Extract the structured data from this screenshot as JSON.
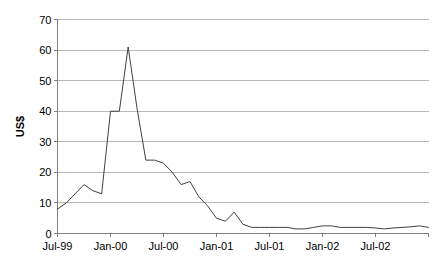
{
  "chart_data": {
    "type": "line",
    "title": "",
    "xlabel": "",
    "ylabel": "US$",
    "ylim": [
      0,
      70
    ],
    "ytick_values": [
      0,
      10,
      20,
      30,
      40,
      50,
      60,
      70
    ],
    "ytick_labels": [
      "0",
      "10",
      "20",
      "30",
      "40",
      "50",
      "60",
      "70"
    ],
    "grid": true,
    "legend": "none",
    "xtick_labels": [
      "Jul-99",
      "Jan-00",
      "Jul-00",
      "Jan-01",
      "Jul-01",
      "Jan-02",
      "Jul-02"
    ],
    "xtick_indices": [
      0,
      6,
      12,
      18,
      24,
      30,
      36
    ],
    "x_index_max": 42,
    "series": [
      {
        "name": "US$",
        "x": [
          "Jul-99",
          "Aug-99",
          "Sep-99",
          "Oct-99",
          "Nov-99",
          "Dec-99",
          "Jan-00",
          "Feb-00",
          "Mar-00",
          "Apr-00",
          "May-00",
          "Jun-00",
          "Jul-00",
          "Aug-00",
          "Sep-00",
          "Oct-00",
          "Nov-00",
          "Dec-00",
          "Jan-01",
          "Feb-01",
          "Mar-01",
          "Apr-01",
          "May-01",
          "Jun-01",
          "Jul-01",
          "Aug-01",
          "Sep-01",
          "Oct-01",
          "Nov-01",
          "Dec-01",
          "Jan-02",
          "Feb-02",
          "Mar-02",
          "Apr-02",
          "May-02",
          "Jun-02",
          "Jul-02",
          "Aug-02",
          "Sep-02",
          "Oct-02",
          "Nov-02",
          "Dec-02",
          "Jan-03"
        ],
        "values": [
          8,
          10,
          13,
          16,
          14,
          13,
          40,
          40,
          61,
          41,
          24,
          24,
          23,
          20,
          16,
          17,
          12,
          9,
          5,
          4,
          7,
          3,
          2,
          2,
          2,
          2,
          2,
          1.5,
          1.5,
          2,
          2.5,
          2.5,
          2,
          2,
          2,
          2,
          1.8,
          1.5,
          1.8,
          2,
          2.2,
          2.5,
          2
        ]
      }
    ]
  },
  "axes": {
    "y_axis_title": "US$"
  }
}
